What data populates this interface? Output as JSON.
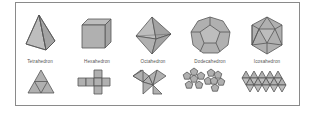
{
  "figure": {
    "title": "",
    "frame_border_color": "#8a8a8a",
    "face_fill_color": "#b0b0b0",
    "edge_color": "#555555",
    "solids": [
      {
        "name": "Tetrahedron",
        "label": "Tetrahedron",
        "faces": 4,
        "face_shape": "triangle",
        "net": "triangle subdivided into 4 triangles"
      },
      {
        "name": "Hexahedron",
        "label": "Hexahedron",
        "faces": 6,
        "face_shape": "square",
        "net": "cross of 6 squares"
      },
      {
        "name": "Octahedron",
        "label": "Octahedron",
        "faces": 8,
        "face_shape": "triangle",
        "net": "8 triangles"
      },
      {
        "name": "Dodecahedron",
        "label": "Dodecahedron",
        "faces": 12,
        "face_shape": "pentagon",
        "net": "two rosettes of 6 pentagons"
      },
      {
        "name": "Icosahedron",
        "label": "Icosahedron",
        "faces": 20,
        "face_shape": "triangle",
        "net": "strip of 20 triangles"
      }
    ]
  }
}
